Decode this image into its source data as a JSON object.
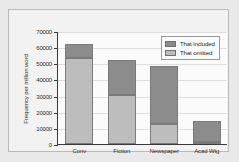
{
  "chart_data": {
    "type": "bar",
    "subtype": "stacked",
    "title": "",
    "xlabel": "",
    "ylabel": "Frequency per million word",
    "categories": [
      "Conv",
      "Fiction",
      "Newspaper",
      "Acad Wtg"
    ],
    "series": [
      {
        "name": "That omitted",
        "values": [
          53000,
          30500,
          12500,
          1000
        ],
        "color": "#bdbdbd"
      },
      {
        "name": "That included",
        "values": [
          9000,
          21500,
          36000,
          13000
        ],
        "color": "#8c8c8c"
      }
    ],
    "totals": [
      62000,
      52000,
      48500,
      14000
    ],
    "ylim": [
      0,
      70000
    ],
    "ytick_labels": [
      "0",
      "10000",
      "20000",
      "30000",
      "40000",
      "50000",
      "60000",
      "70000"
    ],
    "ytick_values": [
      0,
      10000,
      20000,
      30000,
      40000,
      50000,
      60000,
      70000
    ],
    "grid": true,
    "legend_position": "top-right",
    "legend_entries": [
      "That included",
      "That omitted"
    ]
  },
  "colors": {
    "included": "#8c8c8c",
    "omitted": "#bdbdbd",
    "axis": "#3a3a3a",
    "grid": "#dedede",
    "page_background": "#e9e9e9",
    "card_background": "#f2f2f2",
    "plot_background": "#fbfbfb"
  }
}
